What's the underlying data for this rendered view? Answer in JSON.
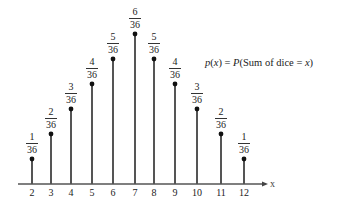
{
  "chart_data": {
    "type": "bar",
    "style": "stem (lollipop) plot",
    "title": "",
    "annotation": "p(x) = P(Sum of dice = x)",
    "xlabel": "x",
    "ylabel": "",
    "categories": [
      "2",
      "3",
      "4",
      "5",
      "6",
      "7",
      "8",
      "9",
      "10",
      "11",
      "12"
    ],
    "x": [
      2,
      3,
      4,
      5,
      6,
      7,
      8,
      9,
      10,
      11,
      12
    ],
    "values": [
      0.0278,
      0.0556,
      0.0833,
      0.1111,
      0.1389,
      0.1667,
      0.1389,
      0.1111,
      0.0833,
      0.0556,
      0.0278
    ],
    "value_labels": [
      "1/36",
      "2/36",
      "3/36",
      "4/36",
      "5/36",
      "6/36",
      "5/36",
      "4/36",
      "3/36",
      "2/36",
      "1/36"
    ],
    "numerators": [
      1,
      2,
      3,
      4,
      5,
      6,
      5,
      4,
      3,
      2,
      1
    ],
    "denominator": 36,
    "ylim": [
      0,
      0.1667
    ],
    "grid": false,
    "legend": null
  },
  "formula": {
    "lhs_func": "p",
    "lhs_var": "x",
    "equals": "=",
    "rhs_func": "P",
    "rhs_text": "Sum of dice",
    "rhs_eq": "=",
    "rhs_var": "x"
  },
  "axis": {
    "x_label": "x"
  },
  "colors": {
    "stem": "#555555",
    "dot": "#111111",
    "axis": "#555555",
    "text": "#222222"
  }
}
